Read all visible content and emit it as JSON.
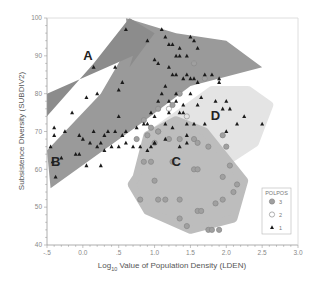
{
  "chart_data": {
    "type": "scatter",
    "title": "",
    "xlabel": "Log10 Value of Population Density (LDEN)",
    "xlabel_parts": {
      "prefix": "Log",
      "subscript": "10",
      "suffix": " Value of Population Density (LDEN)"
    },
    "ylabel": "Subsistence Diversity (SUBDIV2)",
    "xlim": [
      -0.5,
      3.0
    ],
    "ylim": [
      40,
      100
    ],
    "x_ticks": [
      "-.5",
      "0.0",
      ".5",
      "1.0",
      "1.5",
      "2.0",
      "2.5",
      "3.0"
    ],
    "x_tick_values": [
      -0.5,
      0.0,
      0.5,
      1.0,
      1.5,
      2.0,
      2.5,
      3.0
    ],
    "y_ticks": [
      "40",
      "50",
      "60",
      "70",
      "80",
      "90",
      "100"
    ],
    "y_tick_values": [
      40,
      50,
      60,
      70,
      80,
      90,
      100
    ],
    "grid": false,
    "legend": {
      "title": "POLPOS",
      "position": "lower right",
      "entries": [
        {
          "label": "3",
          "marker": "filled-gray-circle"
        },
        {
          "label": "2",
          "marker": "open-circle"
        },
        {
          "label": "1",
          "marker": "filled-triangle"
        }
      ]
    },
    "regions": [
      {
        "label": "A",
        "color": "#8c8c8c",
        "points": [
          [
            -0.5,
            74
          ],
          [
            0.15,
            88
          ],
          [
            0.65,
            100
          ],
          [
            1.0,
            96
          ],
          [
            0.65,
            87
          ],
          [
            0.7,
            90
          ],
          [
            -0.5,
            80
          ]
        ],
        "label_pos": [
          0.07,
          89
        ]
      },
      {
        "label": "B",
        "color": "#9a9a9a",
        "points": [
          [
            -0.45,
            55
          ],
          [
            0.8,
            72
          ],
          [
            1.5,
            82
          ],
          [
            2.5,
            87
          ],
          [
            2.0,
            94
          ],
          [
            1.3,
            96
          ],
          [
            0.6,
            100
          ],
          [
            0.65,
            93
          ],
          [
            0.25,
            80
          ],
          [
            -0.5,
            65
          ]
        ],
        "label_pos": [
          -0.38,
          61
        ]
      },
      {
        "label": "C",
        "color": "#bdbdbd",
        "points": [
          [
            0.75,
            58
          ],
          [
            0.9,
            69
          ],
          [
            1.3,
            73
          ],
          [
            1.7,
            70
          ],
          [
            2.25,
            57
          ],
          [
            2.1,
            47
          ],
          [
            1.5,
            44
          ],
          [
            0.9,
            49
          ],
          [
            0.68,
            56
          ]
        ],
        "label_pos": [
          1.3,
          61
        ]
      },
      {
        "label": "D",
        "color": "#e4e4e4",
        "points": [
          [
            1.0,
            70
          ],
          [
            1.8,
            81
          ],
          [
            2.3,
            81
          ],
          [
            2.6,
            77
          ],
          [
            2.4,
            67
          ],
          [
            2.0,
            62
          ],
          [
            1.6,
            69
          ],
          [
            1.2,
            72
          ]
        ],
        "label_pos": [
          1.85,
          73
        ]
      }
    ],
    "series": [
      {
        "name": "1",
        "marker": "triangle",
        "points": [
          [
            0.6,
            97
          ],
          [
            0.9,
            94
          ],
          [
            1.1,
            97
          ],
          [
            1.15,
            95
          ],
          [
            0.15,
            87
          ],
          [
            0.45,
            87
          ],
          [
            0.55,
            83
          ],
          [
            0.5,
            81
          ],
          [
            0.2,
            80
          ],
          [
            0.05,
            79
          ],
          [
            -0.15,
            75
          ],
          [
            0.5,
            74
          ],
          [
            -0.4,
            71
          ],
          [
            -0.4,
            69
          ],
          [
            -0.25,
            70
          ],
          [
            -0.05,
            69
          ],
          [
            0.0,
            68
          ],
          [
            0.15,
            70
          ],
          [
            0.3,
            69
          ],
          [
            0.35,
            70
          ],
          [
            0.45,
            70
          ],
          [
            0.55,
            69
          ],
          [
            0.6,
            70
          ],
          [
            0.75,
            71
          ],
          [
            -0.45,
            66
          ],
          [
            -0.3,
            63
          ],
          [
            -0.1,
            64
          ],
          [
            0.1,
            67
          ],
          [
            0.2,
            66
          ],
          [
            0.25,
            67
          ],
          [
            0.3,
            65
          ],
          [
            0.4,
            66
          ],
          [
            0.5,
            66
          ],
          [
            0.6,
            67
          ],
          [
            0.7,
            66
          ],
          [
            0.8,
            66
          ],
          [
            0.9,
            65
          ],
          [
            0.95,
            66
          ],
          [
            1.0,
            67
          ],
          [
            -0.42,
            62
          ],
          [
            -0.38,
            58
          ],
          [
            -0.05,
            64
          ],
          [
            0.05,
            61
          ],
          [
            0.25,
            61
          ],
          [
            1.0,
            89
          ],
          [
            1.05,
            88
          ],
          [
            1.2,
            93
          ],
          [
            1.25,
            93
          ],
          [
            1.35,
            92
          ],
          [
            1.5,
            95
          ],
          [
            1.55,
            94
          ],
          [
            1.6,
            92
          ],
          [
            1.3,
            90
          ],
          [
            1.35,
            90
          ],
          [
            1.45,
            90
          ],
          [
            1.2,
            87
          ],
          [
            1.25,
            85
          ],
          [
            1.3,
            85
          ],
          [
            1.4,
            84
          ],
          [
            1.45,
            85
          ],
          [
            1.5,
            84
          ],
          [
            1.55,
            84
          ],
          [
            1.6,
            83
          ],
          [
            1.7,
            85
          ],
          [
            1.8,
            85
          ],
          [
            1.9,
            84
          ],
          [
            1.9,
            83
          ],
          [
            1.15,
            82
          ],
          [
            1.1,
            80
          ],
          [
            1.3,
            80
          ],
          [
            1.5,
            80
          ],
          [
            1.65,
            79
          ],
          [
            1.05,
            78
          ],
          [
            1.2,
            78
          ],
          [
            1.3,
            78
          ],
          [
            1.4,
            77
          ],
          [
            1.2,
            75
          ],
          [
            1.35,
            75
          ],
          [
            1.4,
            75
          ],
          [
            1.6,
            77
          ],
          [
            0.95,
            75
          ],
          [
            1.0,
            74
          ],
          [
            0.85,
            72
          ],
          [
            0.9,
            72
          ],
          [
            1.15,
            72
          ],
          [
            1.25,
            71
          ],
          [
            1.45,
            72
          ],
          [
            1.55,
            72
          ],
          [
            1.7,
            72
          ],
          [
            1.85,
            78
          ],
          [
            1.95,
            76
          ],
          [
            2.05,
            76
          ],
          [
            2.15,
            72
          ],
          [
            2.25,
            74
          ],
          [
            2.5,
            72
          ],
          [
            2.0,
            78
          ],
          [
            2.0,
            70
          ],
          [
            1.45,
            69
          ],
          [
            1.35,
            66
          ],
          [
            1.45,
            67
          ],
          [
            1.15,
            68
          ],
          [
            1.0,
            67
          ]
        ]
      },
      {
        "name": "2",
        "marker": "open-circle",
        "points": [
          [
            1.55,
            89
          ],
          [
            1.85,
            90
          ],
          [
            1.7,
            86
          ],
          [
            1.35,
            82
          ],
          [
            1.2,
            76
          ],
          [
            1.45,
            74
          ]
        ]
      },
      {
        "name": "3",
        "marker": "gray-circle",
        "points": [
          [
            1.7,
            84
          ],
          [
            1.55,
            88
          ],
          [
            1.35,
            80
          ],
          [
            1.25,
            77
          ],
          [
            1.05,
            76
          ],
          [
            0.85,
            73
          ],
          [
            0.95,
            71
          ],
          [
            1.05,
            70
          ],
          [
            0.75,
            68
          ],
          [
            0.9,
            69
          ],
          [
            1.0,
            67
          ],
          [
            1.2,
            68
          ],
          [
            1.35,
            68
          ],
          [
            1.55,
            68
          ],
          [
            1.6,
            67
          ],
          [
            1.75,
            66
          ],
          [
            1.95,
            69
          ],
          [
            2.0,
            66
          ],
          [
            1.05,
            70
          ],
          [
            0.85,
            62
          ],
          [
            0.95,
            62
          ],
          [
            1.25,
            62
          ],
          [
            1.55,
            60
          ],
          [
            1.6,
            60
          ],
          [
            2.05,
            61
          ],
          [
            1.0,
            57
          ],
          [
            0.8,
            52
          ],
          [
            1.05,
            52
          ],
          [
            1.15,
            52
          ],
          [
            1.35,
            52
          ],
          [
            1.6,
            49
          ],
          [
            1.65,
            49
          ],
          [
            1.85,
            51
          ],
          [
            1.95,
            52
          ],
          [
            2.1,
            54
          ],
          [
            2.15,
            56
          ],
          [
            1.95,
            58
          ],
          [
            1.35,
            47
          ],
          [
            1.45,
            45
          ],
          [
            1.75,
            44
          ],
          [
            1.8,
            44
          ],
          [
            1.9,
            44
          ]
        ]
      }
    ]
  },
  "colors": {
    "axis": "#9a9a9a",
    "text": "#777777",
    "triangle": "#1a1a1a",
    "circle_fill": "#a0a0a0",
    "circle_stroke": "#8a8a8a"
  }
}
